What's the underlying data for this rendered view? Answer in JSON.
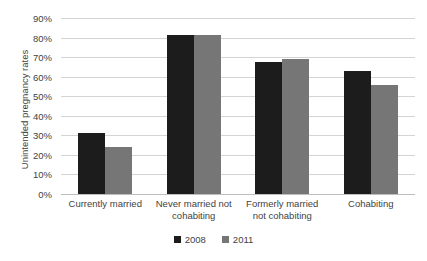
{
  "chart_data": {
    "type": "bar",
    "title": "",
    "subtitle": "",
    "xlabel": "",
    "ylabel": "Unintended pregnancy rates",
    "ylim": [
      0,
      90
    ],
    "ytick_labels": [
      "90%",
      "80%",
      "70%",
      "60%",
      "50%",
      "40%",
      "30%",
      "20%",
      "10%",
      "0%"
    ],
    "ytick_values": [
      90,
      80,
      70,
      60,
      50,
      40,
      30,
      20,
      10,
      0
    ],
    "grid": "horizontal",
    "legend_position": "bottom-center",
    "categories": [
      "Currently married",
      "Never married not cohabiting",
      "Formerly married not cohabiting",
      "Cohabiting"
    ],
    "series": [
      {
        "name": "2008",
        "color": "#1c1c1c",
        "values": [
          31,
          81.5,
          67.5,
          63
        ]
      },
      {
        "name": "2011",
        "color": "#767676",
        "values": [
          24,
          81.5,
          69,
          56
        ]
      }
    ]
  }
}
